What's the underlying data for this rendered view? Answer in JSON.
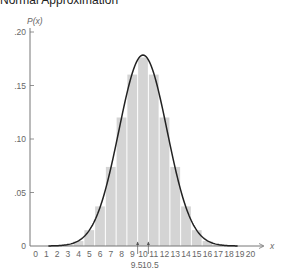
{
  "chart_data": {
    "type": "bar",
    "title": "Normal Approximation",
    "xlabel": "x",
    "ylabel": "P(x)",
    "ylim": [
      0,
      0.2
    ],
    "xlim": [
      0,
      20
    ],
    "y_ticks": [
      ".20",
      ".15",
      ".10",
      ".05",
      "0"
    ],
    "x_ticks": [
      "0",
      "1",
      "2",
      "3",
      "4",
      "5",
      "6",
      "7",
      "8",
      "9",
      "10",
      "11",
      "12",
      "13",
      "14",
      "15",
      "16",
      "17",
      "18",
      "19",
      "20"
    ],
    "annotations": [
      "9.5",
      "10.5"
    ],
    "categories": [
      0,
      1,
      2,
      3,
      4,
      5,
      6,
      7,
      8,
      9,
      10,
      11,
      12,
      13,
      14,
      15,
      16,
      17,
      18,
      19,
      20
    ],
    "series": [
      {
        "name": "Binomial P(x)",
        "values": [
          1e-06,
          2e-05,
          0.0002,
          0.0011,
          0.0046,
          0.0148,
          0.037,
          0.0739,
          0.1201,
          0.1602,
          0.1762,
          0.1602,
          0.1201,
          0.0739,
          0.037,
          0.0148,
          0.0046,
          0.0011,
          0.0002,
          2e-05,
          1e-06
        ]
      },
      {
        "name": "Normal curve",
        "mean": 10,
        "sd": 2.236
      }
    ],
    "grid": false,
    "colors": {
      "bars": "#d4d4d4",
      "curve": "#222222",
      "axis": "#777777"
    }
  }
}
